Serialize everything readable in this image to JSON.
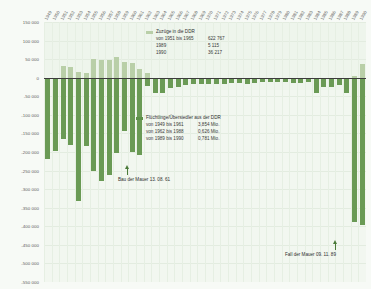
{
  "chart_data": {
    "type": "bar",
    "title": "",
    "xlabel": "",
    "ylabel": "",
    "ylim": [
      -550000,
      150000
    ],
    "grid": true,
    "legend_position": "inside",
    "yticks": [
      "150 000",
      "100 000",
      "50 000",
      "0",
      "-50 000",
      "-100 000",
      "-150 000",
      "-200 000",
      "-250 000",
      "-300 000",
      "-350 000",
      "-400 000",
      "-450 000",
      "-500 000",
      "-550 000"
    ],
    "ytick_values": [
      150000,
      100000,
      50000,
      0,
      -50000,
      -100000,
      -150000,
      -200000,
      -250000,
      -300000,
      -350000,
      -400000,
      -450000,
      -500000,
      -550000
    ],
    "categories": [
      "1949",
      "1950",
      "1951",
      "1952",
      "1953",
      "1954",
      "1955",
      "1956",
      "1957",
      "1958",
      "1959",
      "1960",
      "1961",
      "1962",
      "1963",
      "1964",
      "1965",
      "1966",
      "1967",
      "1968",
      "1969",
      "1970",
      "1971",
      "1972",
      "1973",
      "1974",
      "1975",
      "1976",
      "1977",
      "1978",
      "1979",
      "1980",
      "1981",
      "1982",
      "1983",
      "1984",
      "1985",
      "1986",
      "1987",
      "1988",
      "1989",
      "1990"
    ],
    "series": [
      {
        "name": "Zuzüge in die DDR",
        "color": "#b9cfa8",
        "values": [
          0,
          0,
          31000,
          29000,
          16000,
          14000,
          50000,
          47000,
          49000,
          55000,
          42000,
          40000,
          23000,
          14000,
          0,
          0,
          0,
          0,
          0,
          0,
          0,
          0,
          0,
          0,
          0,
          0,
          0,
          0,
          0,
          0,
          0,
          0,
          0,
          0,
          0,
          0,
          0,
          0,
          0,
          0,
          5115,
          36217
        ]
      },
      {
        "name": "Flüchtlinge/Übersiedler aus der DDR",
        "color": "#6a9a55",
        "values": [
          -220000,
          -197000,
          -165000,
          -182000,
          -331000,
          -184000,
          -252000,
          -279000,
          -262000,
          -204000,
          -143000,
          -199000,
          -207000,
          -21000,
          -42000,
          -41000,
          -29000,
          -24000,
          -19000,
          -16000,
          -17000,
          -17000,
          -17000,
          -17000,
          -15000,
          -13000,
          -16000,
          -15000,
          -12000,
          -12000,
          -12000,
          -12000,
          -15000,
          -13000,
          -11000,
          -41000,
          -25000,
          -26000,
          -19000,
          -40000,
          -389000,
          -396000
        ]
      }
    ],
    "annotations": [
      {
        "id": "bau-der-mauer",
        "text": "Bau der Mauer 13. 08. 61",
        "year": "1961"
      },
      {
        "id": "fall-der-mauer",
        "text": "Fall der Mauer 09. 11. 89",
        "year": "1989"
      }
    ],
    "legends": [
      {
        "id": "zuzuege",
        "title": "Zuzüge in die DDR",
        "swatch_color": "#b9cfa8",
        "rows": [
          {
            "period": "von 1951 bis 1965",
            "value": "622 767"
          },
          {
            "period": "1989",
            "value": "5 115"
          },
          {
            "period": "1990",
            "value": "36 217"
          }
        ]
      },
      {
        "id": "fluechtlinge",
        "title": "Flüchtlinge/Übersiedler aus der DDR",
        "swatch_color": "#5e9149",
        "rows": [
          {
            "period": "von 1949 bis 1961",
            "value": "3,854 Mio."
          },
          {
            "period": "von 1962 bis 1988",
            "value": "0,626 Mio."
          },
          {
            "period": "von 1989 bis 1990",
            "value": "0,781 Mio."
          }
        ]
      }
    ]
  }
}
